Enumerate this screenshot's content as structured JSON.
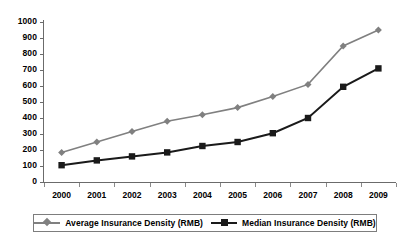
{
  "chart_data": {
    "type": "line",
    "title": "",
    "xlabel": "",
    "ylabel": "",
    "categories": [
      "2000",
      "2001",
      "2002",
      "2003",
      "2004",
      "2005",
      "2006",
      "2007",
      "2008",
      "2009"
    ],
    "ylim": [
      0,
      1000
    ],
    "y_ticks": [
      "1000",
      "900",
      "800",
      "700",
      "600",
      "500",
      "400",
      "300",
      "200",
      "100",
      "0"
    ],
    "grid": false,
    "legend_position": "bottom",
    "series": [
      {
        "name": "Average Insurance Density (RMB)",
        "marker": "diamond",
        "color": "#808080",
        "values": [
          185,
          250,
          315,
          380,
          420,
          465,
          535,
          610,
          850,
          950
        ]
      },
      {
        "name": "Median Insurance Density (RMB)",
        "marker": "square",
        "color": "#1a1a1a",
        "values": [
          105,
          135,
          160,
          185,
          225,
          250,
          305,
          400,
          595,
          710
        ]
      }
    ]
  }
}
